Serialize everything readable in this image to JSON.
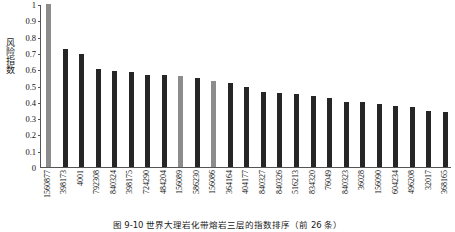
{
  "chart_data": {
    "type": "bar",
    "title": "",
    "xlabel": "",
    "ylabel": "风险指数",
    "ylim": [
      0,
      1
    ],
    "ytick_labels": [
      "1",
      "0.9",
      "0.8",
      "0.7",
      "0.6",
      "0.5",
      "0.4",
      "0.3",
      "0.2",
      "0.1",
      "0"
    ],
    "ytick_values": [
      1,
      0.9,
      0.8,
      0.7,
      0.6,
      0.5,
      0.4,
      0.3,
      0.2,
      0.1,
      0
    ],
    "grid": false,
    "legend": "none",
    "highlight_color": "#8c8c8c",
    "bar_color": "#262626",
    "categories": [
      "1560877",
      "398173",
      "4001",
      "792308",
      "840324",
      "398175",
      "724290",
      "484204",
      "156089",
      "586230",
      "156086",
      "364164",
      "404177",
      "840327",
      "840326",
      "516213",
      "834320",
      "76049",
      "840323",
      "36028",
      "156090",
      "604234",
      "496208",
      "32017",
      "368165"
    ],
    "values": [
      1.0,
      0.725,
      0.695,
      0.6,
      0.59,
      0.58,
      0.565,
      0.565,
      0.56,
      0.545,
      0.53,
      0.515,
      0.49,
      0.46,
      0.455,
      0.45,
      0.435,
      0.425,
      0.4,
      0.4,
      0.385,
      0.375,
      0.37,
      0.345,
      0.335
    ],
    "highlighted": [
      true,
      false,
      false,
      false,
      false,
      false,
      false,
      false,
      true,
      false,
      true,
      false,
      false,
      false,
      false,
      false,
      false,
      false,
      false,
      false,
      false,
      false,
      false,
      false,
      false
    ]
  },
  "caption": {
    "text": "图 9-10  世界大理岩化带熔岩三层的指数排序（前 26 条）"
  }
}
